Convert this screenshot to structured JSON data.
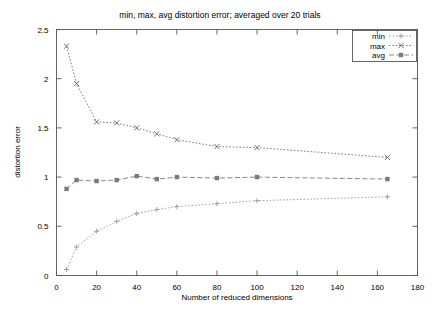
{
  "chart_data": {
    "type": "line",
    "title": "min, max, avg distortion error; averaged over 20 trials",
    "xlabel": "Number of reduced dimensions",
    "ylabel": "distortion error",
    "xlim": [
      0,
      180
    ],
    "ylim": [
      0,
      2.5
    ],
    "xticks": [
      0,
      20,
      40,
      60,
      80,
      100,
      120,
      140,
      160,
      180
    ],
    "xtick_labels": [
      "0",
      "20",
      "40",
      "60",
      "80",
      "100",
      "120",
      "140",
      "160",
      "180"
    ],
    "yticks": [
      0,
      0.5,
      1,
      1.5,
      2,
      2.5
    ],
    "ytick_labels": [
      "0",
      "0.5",
      "1",
      "1.5",
      "2",
      "2.5"
    ],
    "grid": false,
    "legend_position": "top-right",
    "x": [
      5,
      10,
      20,
      30,
      40,
      50,
      60,
      80,
      100,
      165
    ],
    "series": [
      {
        "name": "min",
        "marker": "plus",
        "color": "#9a9a9a",
        "linestyle": "dotted",
        "values": [
          0.06,
          0.29,
          0.45,
          0.55,
          0.63,
          0.67,
          0.7,
          0.73,
          0.76,
          0.8
        ]
      },
      {
        "name": "max",
        "marker": "cross",
        "color": "#6e6e6e",
        "linestyle": "dotted",
        "values": [
          2.33,
          1.95,
          1.56,
          1.55,
          1.5,
          1.44,
          1.38,
          1.31,
          1.3,
          1.2
        ]
      },
      {
        "name": "avg",
        "marker": "square",
        "color": "#7a7a7a",
        "linestyle": "dashed",
        "values": [
          0.88,
          0.97,
          0.96,
          0.97,
          1.01,
          0.98,
          1.0,
          0.99,
          1.0,
          0.98
        ]
      }
    ]
  },
  "legend": {
    "entries": [
      {
        "label": "min"
      },
      {
        "label": "max"
      },
      {
        "label": "avg"
      }
    ]
  }
}
